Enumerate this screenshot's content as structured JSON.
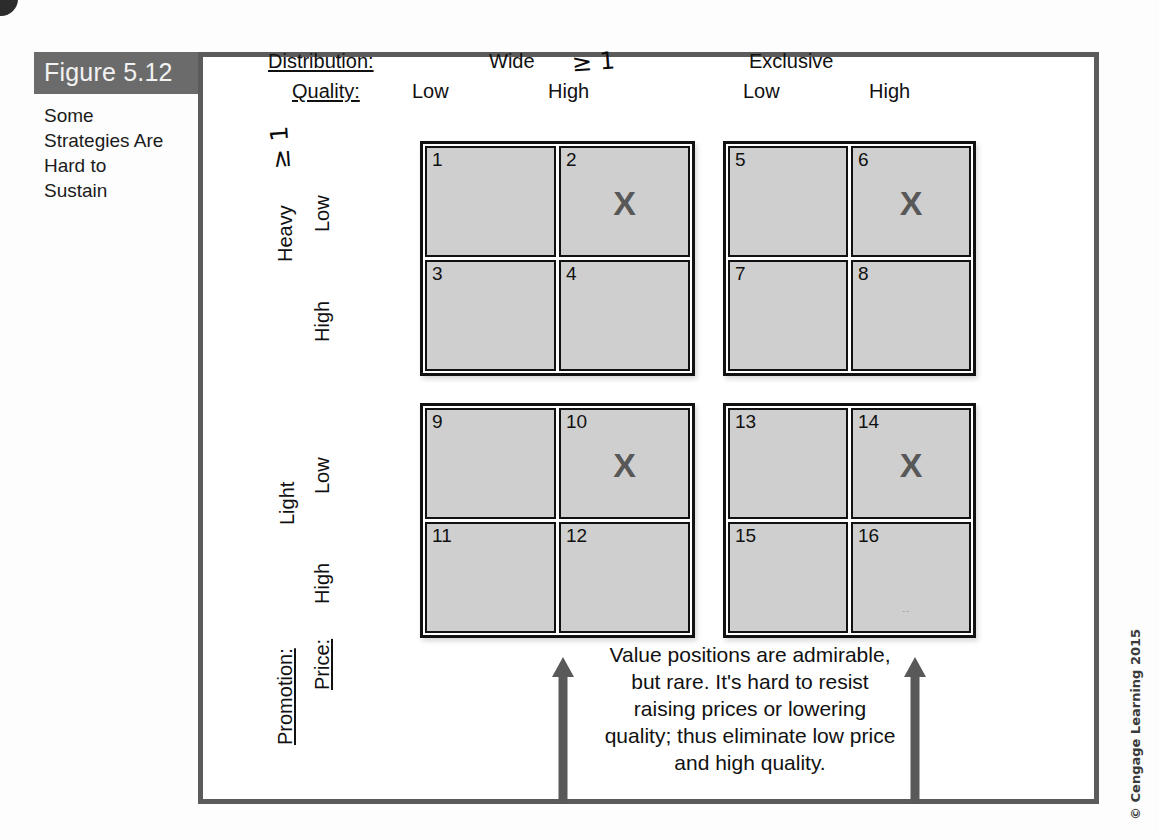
{
  "figure": {
    "label": "Figure 5.12",
    "title": "Some Strategies Are Hard to Sustain",
    "copyright": "© Cengage Learning 2015"
  },
  "headers": {
    "distribution_label": "Distribution:",
    "quality_label": "Quality:",
    "distribution_values": [
      "Wide",
      "Exclusive"
    ],
    "quality_values": [
      "Low",
      "High",
      "Low",
      "High"
    ],
    "handwritten_wide_mark": "≥ 1"
  },
  "row_axis": {
    "promotion_label": "Promotion:",
    "price_label": "Price:",
    "promotion_values": [
      "Heavy",
      "Light"
    ],
    "price_values": [
      "Low",
      "High",
      "Low",
      "High"
    ],
    "handwritten_heavy_mark": "≥ 1"
  },
  "quadrants": [
    {
      "name": "wide-heavy",
      "distribution": "Wide",
      "promotion": "Heavy",
      "cells": [
        {
          "number": "1",
          "quality": "Low",
          "price": "Low",
          "mark": ""
        },
        {
          "number": "2",
          "quality": "High",
          "price": "Low",
          "mark": "X"
        },
        {
          "number": "3",
          "quality": "Low",
          "price": "High",
          "mark": ""
        },
        {
          "number": "4",
          "quality": "High",
          "price": "High",
          "mark": ""
        }
      ]
    },
    {
      "name": "exclusive-heavy",
      "distribution": "Exclusive",
      "promotion": "Heavy",
      "cells": [
        {
          "number": "5",
          "quality": "Low",
          "price": "Low",
          "mark": ""
        },
        {
          "number": "6",
          "quality": "High",
          "price": "Low",
          "mark": "X"
        },
        {
          "number": "7",
          "quality": "Low",
          "price": "High",
          "mark": ""
        },
        {
          "number": "8",
          "quality": "High",
          "price": "High",
          "mark": ""
        }
      ]
    },
    {
      "name": "wide-light",
      "distribution": "Wide",
      "promotion": "Light",
      "cells": [
        {
          "number": "9",
          "quality": "Low",
          "price": "Low",
          "mark": ""
        },
        {
          "number": "10",
          "quality": "High",
          "price": "Low",
          "mark": "X"
        },
        {
          "number": "11",
          "quality": "Low",
          "price": "High",
          "mark": ""
        },
        {
          "number": "12",
          "quality": "High",
          "price": "High",
          "mark": ""
        }
      ]
    },
    {
      "name": "exclusive-light",
      "distribution": "Exclusive",
      "promotion": "Light",
      "cells": [
        {
          "number": "13",
          "quality": "Low",
          "price": "Low",
          "mark": ""
        },
        {
          "number": "14",
          "quality": "High",
          "price": "Low",
          "mark": "X"
        },
        {
          "number": "15",
          "quality": "Low",
          "price": "High",
          "mark": ""
        },
        {
          "number": "16",
          "quality": "High",
          "price": "High",
          "mark": ""
        }
      ]
    }
  ],
  "caption": "Value positions are admirable, but rare. It's hard to resist raising prices or lowering quality; thus eliminate low price and high quality."
}
